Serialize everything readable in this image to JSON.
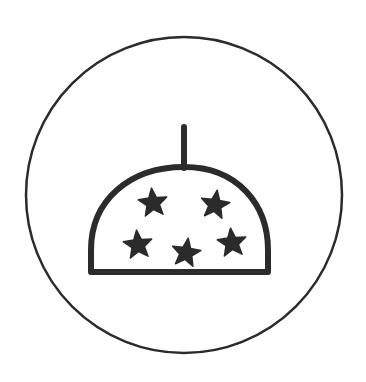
{
  "figure": {
    "colors": {
      "stroke": "#2b2b2b",
      "fill": "#2b2b2b",
      "background": "#ffffff"
    },
    "circle": {
      "cx": 184,
      "cy": 195,
      "r": 158
    },
    "dome": {
      "left_x": 90,
      "right_x": 268,
      "base_y": 272,
      "top_y": 165
    },
    "antenna": {
      "x": 184,
      "top_y": 125,
      "bottom_y": 167
    },
    "stars": [
      {
        "cx": 153,
        "cy": 203
      },
      {
        "cx": 215,
        "cy": 205
      },
      {
        "cx": 138,
        "cy": 245
      },
      {
        "cx": 186,
        "cy": 253
      },
      {
        "cx": 232,
        "cy": 243
      }
    ]
  }
}
